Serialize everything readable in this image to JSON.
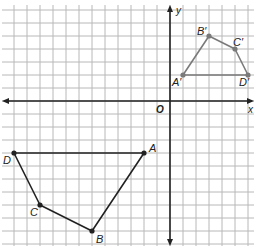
{
  "diagram": {
    "type": "coordinate-plane-translation",
    "grid": {
      "cell_px": 13,
      "origin_px": [
        170,
        101
      ],
      "x_range": [
        -13,
        6
      ],
      "y_range": [
        -11,
        7
      ],
      "grid_color": "#b8b8b8",
      "axis_color": "#222222"
    },
    "axes": {
      "x_label": "x",
      "y_label": "y",
      "origin_label": "O"
    },
    "figures": [
      {
        "name": "original",
        "color": "#222222",
        "vertices": [
          {
            "label": "A",
            "x": -2,
            "y": -4
          },
          {
            "label": "B",
            "x": -6,
            "y": -10
          },
          {
            "label": "C",
            "x": -10,
            "y": -8
          },
          {
            "label": "D",
            "x": -12,
            "y": -4
          }
        ]
      },
      {
        "name": "image",
        "color": "#7a7a7a",
        "vertices": [
          {
            "label": "A′",
            "x": 1,
            "y": 2
          },
          {
            "label": "B′",
            "x": 3,
            "y": 5
          },
          {
            "label": "C′",
            "x": 5,
            "y": 4
          },
          {
            "label": "D′",
            "x": 6,
            "y": 2
          }
        ]
      }
    ]
  }
}
